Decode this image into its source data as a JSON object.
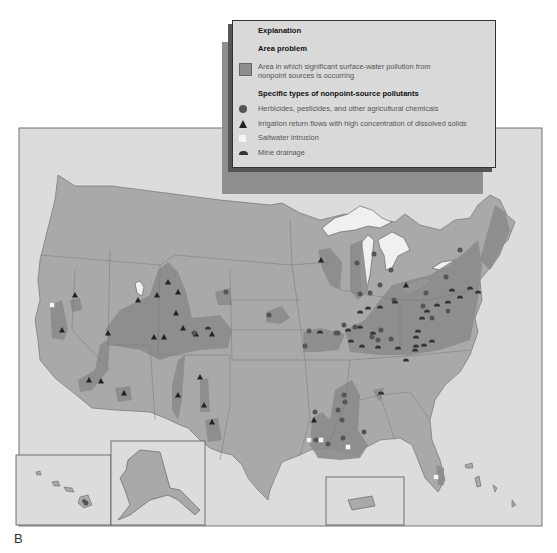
{
  "figure_label": "B",
  "legend": {
    "title": "Explanation",
    "area_heading": "Area problem",
    "area_item_line1": "Area in which significant surface-water pollution from",
    "area_item_line2": "nonpoint sources is occurring",
    "types_heading": "Specific types of nonpoint-source pollutants",
    "items": [
      {
        "symbol": "circle-icon",
        "label": "Herbicides, pesticides, and other agricultural chemicals"
      },
      {
        "symbol": "triangle-icon",
        "label": "Irrigation return flows with high concentration of dissolved solids"
      },
      {
        "symbol": "square-icon",
        "label": "Saltwater intrusion"
      },
      {
        "symbol": "dome-icon",
        "label": "Mine drainage"
      }
    ]
  },
  "colors": {
    "background": "#dcdcdc",
    "land": "#a9a9a9",
    "problem_area": "#8c8c8c",
    "lakes": "#f0f0f0",
    "symbol": "#3a3a3a"
  },
  "insets": [
    "Hawaii",
    "Alaska",
    "Puerto Rico"
  ]
}
